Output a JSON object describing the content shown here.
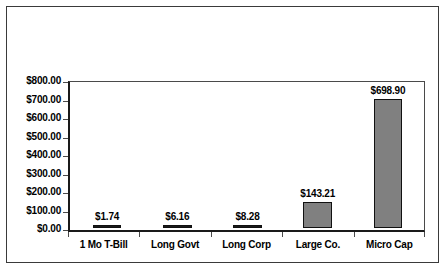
{
  "chart_data": {
    "type": "bar",
    "title": "",
    "xlabel": "",
    "ylabel": "",
    "categories": [
      "1 Mo T-Bill",
      "Long Govt",
      "Long Corp",
      "Large Co.",
      "Micro Cap"
    ],
    "values": [
      1.74,
      6.16,
      8.28,
      143.21,
      698.9
    ],
    "data_labels": [
      "$1.74",
      "$6.16",
      "$8.28",
      "$143.21",
      "$698.90"
    ],
    "ylim": [
      0,
      800
    ],
    "ytick_values": [
      800,
      700,
      600,
      500,
      400,
      300,
      200,
      100,
      0
    ],
    "ytick_labels": [
      "$800.00",
      "$700.00",
      "$600.00",
      "$500.00",
      "$400.00",
      "$300.00",
      "$200.00",
      "$100.00",
      "$0.00"
    ],
    "grid": false,
    "legend": null,
    "colors": {
      "bar_fill": "#808080",
      "bar_border": "#111111",
      "small_bar_fill": "#1a1a1a",
      "axis": "#1a1a1a",
      "plot_border": "#4a4a4a",
      "frame_border": "#3a3a3a",
      "background": "#ffffff",
      "text": "#000000"
    }
  }
}
